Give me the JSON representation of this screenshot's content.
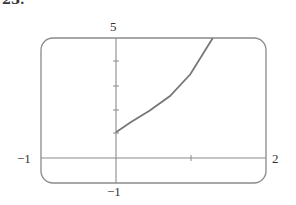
{
  "problem_number": "23.",
  "chart_data": {
    "type": "line",
    "title": "",
    "xlabel": "",
    "ylabel": "",
    "xlim": [
      -1,
      2
    ],
    "ylim": [
      -1,
      5
    ],
    "grid": false,
    "x_tick_labels": {
      "left": "−1",
      "right": "2"
    },
    "y_tick_labels": {
      "top": "5",
      "bottom": "−1"
    },
    "x_ticks": [
      1
    ],
    "y_ticks": [
      1,
      2,
      3,
      4
    ],
    "series": [
      {
        "name": "curve",
        "x": [
          0,
          0.19,
          0.45,
          0.72,
          0.99,
          1.29
        ],
        "y": [
          1.1,
          1.5,
          2.0,
          2.6,
          3.5,
          5.0
        ]
      }
    ],
    "colors": {
      "axis": "#888888",
      "curve": "#777777",
      "frame": "#888888"
    }
  }
}
